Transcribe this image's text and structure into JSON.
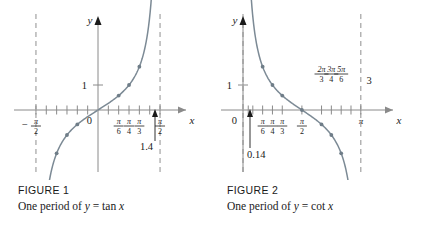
{
  "page": {
    "background_color": "#ffffff",
    "ink_color": "#1a1a1a",
    "curve_color": "#7c8a95",
    "axis_color": "#8a8a8a",
    "asymptote_color": "#9a9a9a"
  },
  "figures": [
    {
      "id": "figure-1",
      "caption_label": "FIGURE 1",
      "caption_prefix": "One period of ",
      "caption_y": "y",
      "caption_equals": " = ",
      "caption_func": "tan",
      "caption_arg": " x",
      "axis_x_name": "x",
      "axis_y_name": "y",
      "origin_label": "0",
      "y_tick_label": "1",
      "annotation": "1.4",
      "x_tick_labels": [
        {
          "value": -1.5708,
          "num": "π",
          "den": "2",
          "sign": "−",
          "position": "below"
        },
        {
          "value": 0.5236,
          "num": "π",
          "den": "6",
          "sign": "",
          "position": "below"
        },
        {
          "value": 0.7854,
          "num": "π",
          "den": "4",
          "sign": "",
          "position": "below"
        },
        {
          "value": 1.0472,
          "num": "π",
          "den": "3",
          "sign": "",
          "position": "below"
        },
        {
          "value": 1.5708,
          "num": "π",
          "den": "2",
          "sign": "",
          "position": "below"
        }
      ],
      "asymptotes": [
        -1.5708,
        1.5708
      ],
      "marked_points": [
        {
          "x": -1.3734,
          "y": -5.0
        },
        {
          "x": -1.0472,
          "y": -1.732
        },
        {
          "x": -0.7854,
          "y": -1.0
        },
        {
          "x": -0.5236,
          "y": -0.577
        },
        {
          "x": 0.5236,
          "y": 0.577
        },
        {
          "x": 0.7854,
          "y": 1.0
        },
        {
          "x": 1.0472,
          "y": 1.732
        },
        {
          "x": 1.3734,
          "y": 5.0
        }
      ]
    },
    {
      "id": "figure-2",
      "caption_label": "FIGURE 2",
      "caption_prefix": "One period of ",
      "caption_y": "y",
      "caption_equals": " = ",
      "caption_func": "cot",
      "caption_arg": " x",
      "axis_x_name": "x",
      "axis_y_name": "y",
      "origin_label": "0",
      "y_tick_label": "1",
      "annotation": "0.14",
      "upper_label_three": "3",
      "x_tick_labels": [
        {
          "value": 0.5236,
          "num": "π",
          "den": "6",
          "sign": "",
          "position": "below"
        },
        {
          "value": 0.7854,
          "num": "π",
          "den": "4",
          "sign": "",
          "position": "below"
        },
        {
          "value": 1.0472,
          "num": "π",
          "den": "3",
          "sign": "",
          "position": "below"
        },
        {
          "value": 1.5708,
          "num": "π",
          "den": "2",
          "sign": "",
          "position": "below"
        },
        {
          "value": 2.0944,
          "num": "2π",
          "den": "3",
          "sign": "",
          "position": "above"
        },
        {
          "value": 2.3562,
          "num": "3π",
          "den": "4",
          "sign": "",
          "position": "above"
        },
        {
          "value": 2.618,
          "num": "5π",
          "den": "6",
          "sign": "",
          "position": "above"
        }
      ],
      "pi_label": "π",
      "asymptotes": [
        0,
        3.1416
      ],
      "marked_points": [
        {
          "x": 0.1402,
          "y": 7.1
        },
        {
          "x": 0.5236,
          "y": 1.732
        },
        {
          "x": 0.7854,
          "y": 1.0
        },
        {
          "x": 1.0472,
          "y": 0.577
        },
        {
          "x": 1.5708,
          "y": 0.0
        },
        {
          "x": 2.0944,
          "y": -0.577
        },
        {
          "x": 2.3562,
          "y": -1.0
        },
        {
          "x": 2.618,
          "y": -1.732
        },
        {
          "x": 3.0014,
          "y": -7.1
        }
      ]
    }
  ]
}
